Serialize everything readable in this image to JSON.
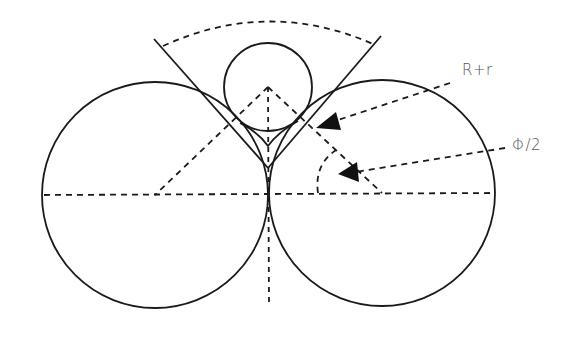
{
  "figure": {
    "type": "geometry-diagram",
    "labels": {
      "sum_of_radii": "R+r",
      "half_angle": "Φ/2"
    },
    "colors": {
      "stroke": "#1a1a1a",
      "label_text": "#555555",
      "background": "#ffffff"
    },
    "geometry": {
      "large_circle_left": {
        "cx": 155,
        "cy": 195,
        "r": 113
      },
      "large_circle_right": {
        "cx": 382,
        "cy": 193,
        "r": 113
      },
      "small_circle": {
        "cx": 268,
        "cy": 87,
        "r": 44
      }
    }
  }
}
